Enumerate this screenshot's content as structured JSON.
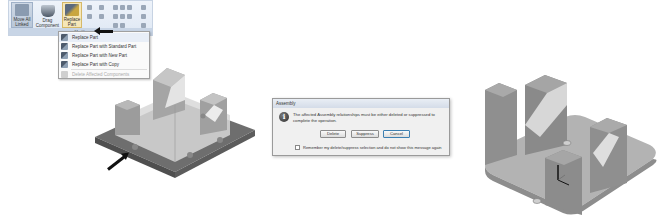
{
  "ribbon": {
    "buttons": [
      {
        "label": "Move All Linked",
        "icon": "move-all-icon"
      },
      {
        "label": "Drag Component",
        "icon": "drag-component-icon"
      },
      {
        "label": "Replace Part",
        "icon": "replace-part-icon",
        "has_dropdown": true
      }
    ],
    "group_label": "Modify"
  },
  "replace_menu": {
    "items": [
      {
        "label": "Replace Part",
        "icon": "replace-part-icon",
        "enabled": true,
        "highlighted": true
      },
      {
        "label": "Replace Part with Standard Part",
        "icon": "replace-standard-icon",
        "enabled": true
      },
      {
        "label": "Replace Part with New Part",
        "icon": "replace-new-icon",
        "enabled": true
      },
      {
        "label": "Replace Part with Copy",
        "icon": "replace-copy-icon",
        "enabled": true
      },
      {
        "label": "Delete Affected Components",
        "icon": "delete-affected-icon",
        "enabled": false
      }
    ]
  },
  "dialog": {
    "title": "Assembly",
    "icon": "info-icon",
    "icon_glyph": "i",
    "message": "The affected Assembly relationships must be either deleted or suppressed to complete the operation.",
    "buttons": {
      "delete": "Delete",
      "suppress": "Suppress",
      "cancel": "Cancel"
    },
    "checkbox_label": "Remember my delete/suppress selection and do not show this message again",
    "checkbox_checked": false
  },
  "models": {
    "left": {
      "description": "V-block assembly with transparent base, callout arrow at base plate",
      "base_color": "#6e6e6e",
      "part_color": "#c8c8c8"
    },
    "right": {
      "description": "Replaced V-block assembly with rounded base plate and coordinate triad",
      "base_color": "#a9a9a9",
      "part_color": "#9a9a9a"
    }
  }
}
